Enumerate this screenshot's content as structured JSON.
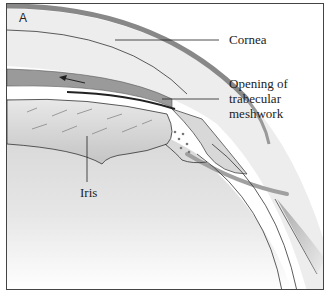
{
  "figure": {
    "panel_letter": "A",
    "labels": {
      "cornea": "Cornea",
      "opening_line1": "Opening of",
      "opening_line2": "trabecular",
      "opening_line3": "meshwork",
      "iris": "Iris"
    },
    "colors": {
      "cornea_outer": "#8a8a8a",
      "cornea_fill": "#ececec",
      "iris_band": "#9a9a9a",
      "lens_gradient_top": "#d4d4d4",
      "lens_gradient_bottom": "#ffffff",
      "outline": "#333333",
      "frame": "#444444"
    },
    "arrow": {
      "direction": "left"
    }
  }
}
